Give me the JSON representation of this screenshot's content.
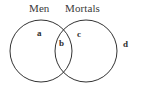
{
  "figure": {
    "type": "venn-diagram",
    "sets": 2,
    "background_color": "#ffffff",
    "stroke_color": "#333333",
    "stroke_width": 1
  },
  "titles": {
    "left_set": "Men",
    "right_set": "Mortals"
  },
  "regions": [
    {
      "key": "a",
      "label": "a",
      "meaning": "Men only"
    },
    {
      "key": "b",
      "label": "b",
      "meaning": "Men and Mortals"
    },
    {
      "key": "c",
      "label": "c",
      "meaning": "Mortals only"
    },
    {
      "key": "d",
      "label": "d",
      "meaning": "Outside both sets"
    }
  ],
  "region_labels": {
    "a": "a",
    "b": "b",
    "c": "c",
    "d": "d"
  },
  "geometry": {
    "left_circle": {
      "cx": 41,
      "cy": 51,
      "r": 31
    },
    "right_circle": {
      "cx": 86,
      "cy": 51,
      "r": 31
    }
  }
}
